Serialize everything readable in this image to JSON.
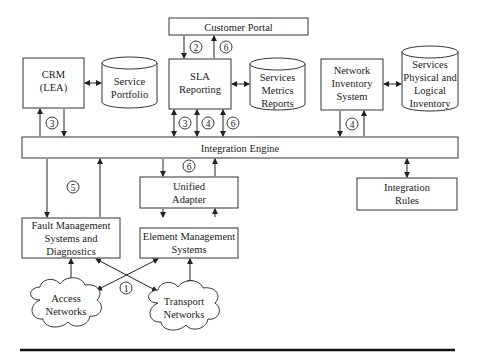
{
  "nodes": {
    "customer_portal": {
      "lines": [
        "Customer Portal"
      ]
    },
    "crm": {
      "lines": [
        "CRM",
        "(LEA)"
      ]
    },
    "service_portfolio": {
      "lines": [
        "Service",
        "Portfolio"
      ]
    },
    "sla_reporting": {
      "lines": [
        "SLA",
        "Reporting"
      ]
    },
    "services_metrics": {
      "lines": [
        "Services",
        "Metrics",
        "Reports"
      ]
    },
    "network_inventory": {
      "lines": [
        "Network",
        "Inventory",
        "System"
      ]
    },
    "physical_logical_inventory": {
      "lines": [
        "Services",
        "Physical and",
        "Logical",
        "Inventory"
      ]
    },
    "integration_engine": {
      "lines": [
        "Integration Engine"
      ]
    },
    "unified_adapter": {
      "lines": [
        "Unified",
        "Adapter"
      ]
    },
    "integration_rules": {
      "lines": [
        "Integration",
        "Rules"
      ]
    },
    "fault_management": {
      "lines": [
        "Fault Management",
        "Systems and",
        "Diagnostics"
      ]
    },
    "element_management": {
      "lines": [
        "Element Management",
        "Systems"
      ]
    },
    "access_networks": {
      "lines": [
        "Access",
        "Networks"
      ]
    },
    "transport_networks": {
      "lines": [
        "Transport",
        "Networks"
      ]
    }
  },
  "badges": [
    "2",
    "6",
    "3",
    "3",
    "4",
    "6",
    "4",
    "6",
    "5",
    "1"
  ]
}
